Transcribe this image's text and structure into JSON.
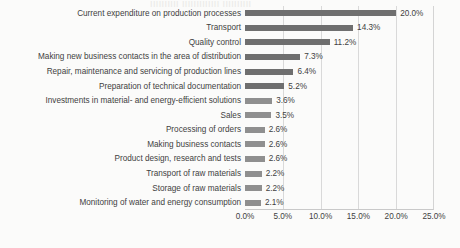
{
  "chart_data": {
    "type": "bar",
    "orientation": "horizontal",
    "title": "",
    "xlabel": "",
    "ylabel": "",
    "xlim": [
      0,
      25
    ],
    "grid": true,
    "legend": false,
    "value_suffix": "%",
    "xticks": [
      "0.0%",
      "5.0%",
      "10.0%",
      "15.0%",
      "20.0%",
      "25.0%"
    ],
    "xtick_values": [
      0,
      5,
      10,
      15,
      20,
      25
    ],
    "categories": [
      "Current expenditure on production processes",
      "Transport",
      "Quality control",
      "Making new business contacts in the area of distribution",
      "Repair, maintenance and servicing of production lines",
      "Preparation of technical documentation",
      "Investments in material- and energy-efficient solutions",
      "Sales",
      "Processing of orders",
      "Making business contacts",
      "Product design, research and tests",
      "Transport of raw materials",
      "Storage of raw materials",
      "Monitoring of water and energy consumption"
    ],
    "values": [
      20.0,
      14.3,
      11.2,
      7.3,
      6.4,
      5.2,
      3.6,
      3.5,
      2.6,
      2.6,
      2.6,
      2.2,
      2.2,
      2.1
    ],
    "data_labels": [
      "20.0%",
      "14.3%",
      "11.2%",
      "7.3%",
      "6.4%",
      "5.2%",
      "3.6%",
      "3.5%",
      "2.6%",
      "2.6%",
      "2.6%",
      "2.2%",
      "2.2%",
      "2.1%"
    ],
    "bar_color": "#6f6f6f",
    "background_color": "#fbfbfa",
    "gridline_color": "#d9d9d9"
  },
  "artifacts": {
    "ghost_top": "IIIIIIIIII  IIIIIIIIIIIII  IIIIIIIIII",
    "ghost_left_1": "",
    "ghost_left_2": ""
  }
}
